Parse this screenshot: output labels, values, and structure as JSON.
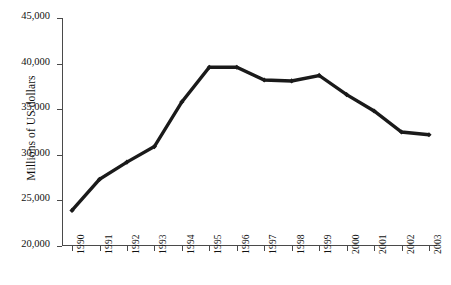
{
  "chart_data": {
    "type": "line",
    "title": "",
    "subtitle": "",
    "xlabel": "",
    "ylabel": "Millions of US dollars",
    "categories": [
      "1990",
      "1991",
      "1992",
      "1993",
      "1994",
      "1995",
      "1996",
      "1997",
      "1998",
      "1999",
      "2000",
      "2001",
      "2002",
      "2003"
    ],
    "values": [
      23900,
      27300,
      29200,
      30900,
      35800,
      39600,
      39600,
      38200,
      38100,
      38700,
      36600,
      34800,
      32500,
      32200
    ],
    "series": [
      {
        "name": "Millions of US dollars",
        "values": [
          23900,
          27300,
          29200,
          30900,
          35800,
          39600,
          39600,
          38200,
          38100,
          38700,
          36600,
          34800,
          32500,
          32200
        ]
      }
    ],
    "ylim": [
      20000,
      45000
    ],
    "ytick_values": [
      20000,
      25000,
      30000,
      35000,
      40000,
      45000
    ],
    "ytick_labels": [
      "20,000",
      "25,000",
      "30,000",
      "35,000",
      "40,000",
      "45,000"
    ],
    "xtick_labels": [
      "1990",
      "1991",
      "1992",
      "1993",
      "1994",
      "1995",
      "1996",
      "1997",
      "1998",
      "1999",
      "2000",
      "2001",
      "2002",
      "2003"
    ],
    "grid": false,
    "legend": false,
    "legend_position": "none",
    "line_color": "#1a1a1a",
    "axis_color": "#4a4a4a",
    "background_color": "#ffffff",
    "marker": "small-diamond",
    "xtick_label_rotation": -90
  }
}
